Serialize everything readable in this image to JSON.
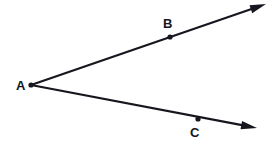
{
  "figure": {
    "type": "geometry-diagram",
    "background_color": "#ffffff",
    "stroke_color": "#16161f",
    "point_color": "#16161f",
    "label_color": "#14141e",
    "width": 275,
    "height": 146
  },
  "points": [
    {
      "id": "A",
      "label": "A",
      "role": "vertex",
      "x": 31,
      "y": 85,
      "label_x": 16,
      "label_y": 79,
      "dot_radius": 2.6
    },
    {
      "id": "B",
      "label": "B",
      "role": "ray-point",
      "x": 170,
      "y": 37,
      "label_x": 163,
      "label_y": 17,
      "dot_radius": 2.6
    },
    {
      "id": "C",
      "label": "C",
      "role": "ray-point",
      "x": 198,
      "y": 119,
      "label_x": 190,
      "label_y": 126,
      "dot_radius": 2.6
    }
  ],
  "rays": [
    {
      "id": "ray-AB",
      "label": "ray AB",
      "from": "A",
      "through": "B",
      "start": {
        "x": 31,
        "y": 85
      },
      "end": {
        "x": 266,
        "y": 4
      },
      "arrow_at_end": true,
      "stroke_width": 2.2
    },
    {
      "id": "ray-AC",
      "label": "ray AC",
      "from": "A",
      "through": "C",
      "start": {
        "x": 31,
        "y": 85
      },
      "end": {
        "x": 257,
        "y": 128
      },
      "arrow_at_end": true,
      "stroke_width": 2.2
    }
  ],
  "arrowheads": [
    {
      "id": "arrowhead-upper",
      "tip_x": 266,
      "tip_y": 4,
      "length": 16,
      "half_width": 4.2
    },
    {
      "id": "arrowhead-lower",
      "tip_x": 257,
      "tip_y": 128,
      "length": 16,
      "half_width": 4.2
    }
  ]
}
